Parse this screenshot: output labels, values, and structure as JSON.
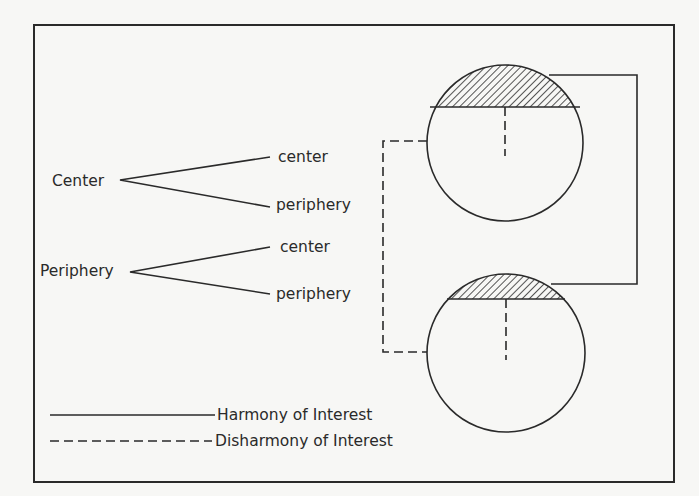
{
  "diagram": {
    "type": "center-periphery interest relations",
    "tree": [
      {
        "root": "Center",
        "branches": [
          "center",
          "periphery"
        ]
      },
      {
        "root": "Periphery",
        "branches": [
          "center",
          "periphery"
        ]
      }
    ],
    "nations": [
      {
        "id": "top-nation",
        "center_region": "hatched",
        "description": "circle with hatched center segment"
      },
      {
        "id": "bottom-nation",
        "center_region": "hatched",
        "description": "circle with hatched center segment"
      }
    ],
    "connections": [
      {
        "from": "top-nation.center",
        "to": "bottom-nation.center",
        "style": "solid",
        "meaning": "Harmony of Interest"
      },
      {
        "from": "top-nation.periphery",
        "to": "bottom-nation.periphery",
        "style": "dashed",
        "meaning": "Disharmony of Interest"
      }
    ],
    "legend": {
      "solid": "Harmony of Interest",
      "dashed": "Disharmony of Interest"
    }
  },
  "colors": {
    "ink": "#2a2a2a",
    "paper": "#f7f7f5"
  }
}
